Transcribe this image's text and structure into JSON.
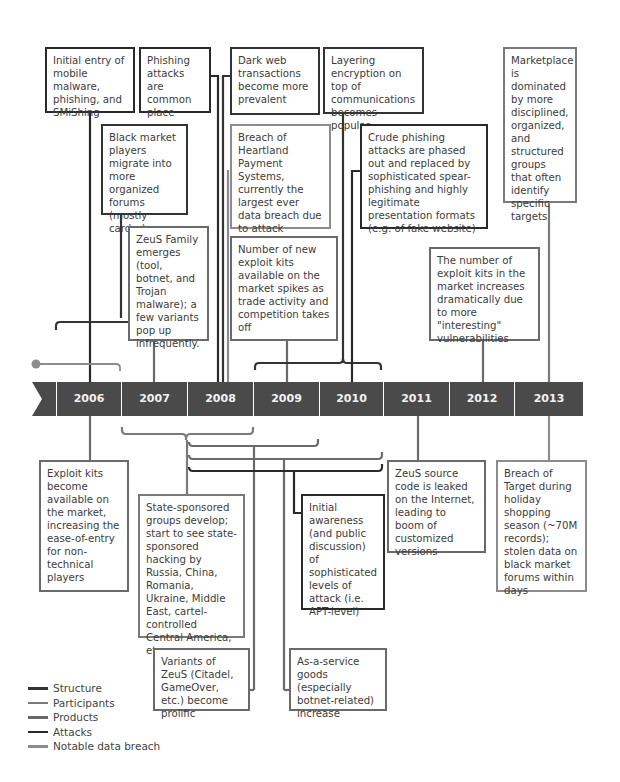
{
  "colors": {
    "structure": "#333333",
    "participants": "#7a7a7a",
    "products": "#6a6a6a",
    "attacks": "#2a2a2a",
    "notable_data_breach": "#8c8c8c",
    "timeline_bar": "#4a4a4a"
  },
  "timeline": {
    "years": [
      "2006",
      "2007",
      "2008",
      "2009",
      "2010",
      "2011",
      "2012",
      "2013"
    ],
    "marker_icon": "numbered-circle-1"
  },
  "events_above": [
    {
      "id": "mobile-malware",
      "category": "Attacks",
      "text": "Initial entry of mobile malware, phishing, and SMiShing"
    },
    {
      "id": "phishing-common",
      "category": "Attacks",
      "text": "Phishing attacks are common place"
    },
    {
      "id": "dark-web",
      "category": "Structure",
      "text": "Dark web transactions become more prevalent"
    },
    {
      "id": "layering-encryption",
      "category": "Structure",
      "text": "Layering encryption on top of communications becomes popular"
    },
    {
      "id": "marketplace-dominated",
      "category": "Participants",
      "text": "Marketplace is dominated by more disciplined, organized, and structured groups that often identify specific targets"
    },
    {
      "id": "black-market-forums",
      "category": "Structure",
      "text": "Black market players migrate into more organized forums (mostly carder)"
    },
    {
      "id": "heartland-breach",
      "category": "Notable data breach",
      "text": "Breach of Heartland Payment Systems, currently the largest ever data breach due to attack (~130M records)"
    },
    {
      "id": "crude-phishing",
      "category": "Attacks",
      "text": "Crude phishing attacks are phased out and replaced by sophisticated spear-phishing and highly legitimate presentation formats (e.g. of fake website)"
    },
    {
      "id": "zeus-family",
      "category": "Products",
      "text": "ZeuS Family emerges (tool, botnet, and Trojan malware); a few variants pop up infrequently."
    },
    {
      "id": "exploit-kits-spike",
      "category": "Products",
      "text": "Number of new exploit kits available on the market spikes as trade activity and competition takes off"
    },
    {
      "id": "exploit-kits-increase",
      "category": "Products",
      "text": "The number of exploit kits in the market increases dramatically due to more \"interesting\" vulnerabilities"
    }
  ],
  "events_below": [
    {
      "id": "exploit-kits-available",
      "category": "Products",
      "text": "Exploit kits become available on the market, increasing the ease-of-entry for non-technical players"
    },
    {
      "id": "state-sponsored",
      "category": "Participants",
      "text": "State-sponsored groups develop; start to see state-sponsored hacking by Russia, China, Romania, Ukraine, Middle East, cartel-controlled Central America, etc."
    },
    {
      "id": "apt-awareness",
      "category": "Attacks",
      "text": "Initial awareness (and public discussion) of sophisticated levels of attack (i.e. APT-level)"
    },
    {
      "id": "zeus-leaked",
      "category": "Products",
      "text": "ZeuS source code is leaked on the Internet, leading to boom of customized versions"
    },
    {
      "id": "target-breach",
      "category": "Notable data breach",
      "text": "Breach of Target during holiday shopping season (~70M records); stolen data on black market forums within days"
    },
    {
      "id": "zeus-variants",
      "category": "Products",
      "text": "Variants of ZeuS (Citadel, GameOver, etc.) become prolific"
    },
    {
      "id": "as-a-service",
      "category": "Products",
      "text": "As-a-service goods (especially botnet-related) increase"
    }
  ],
  "legend": [
    {
      "label": "Structure",
      "color": "#333333"
    },
    {
      "label": "Participants",
      "color": "#7a7a7a"
    },
    {
      "label": "Products",
      "color": "#6a6a6a"
    },
    {
      "label": "Attacks",
      "color": "#2a2a2a"
    },
    {
      "label": "Notable data breach",
      "color": "#8c8c8c"
    }
  ]
}
